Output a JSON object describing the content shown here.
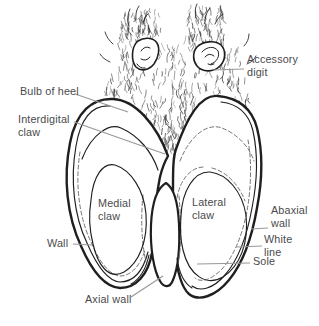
{
  "diagram": {
    "labels": {
      "accessory_digit": "Accessory\ndigit",
      "bulb_of_heel": "Bulb of heel",
      "interdigital_claw": "Interdigital\nclaw",
      "medial_claw": "Medial\nclaw",
      "lateral_claw": "Lateral\nclaw",
      "abaxial_wall": "Abaxial\nwall",
      "white_line": "White\nline",
      "sole": "Sole",
      "wall": "Wall",
      "axial_wall": "Axial wall"
    },
    "colors": {
      "ink": "#1f1f1f",
      "leader": "#989899",
      "label_text": "#4a4a4c",
      "dash": "#757577",
      "background": "#ffffff"
    }
  }
}
